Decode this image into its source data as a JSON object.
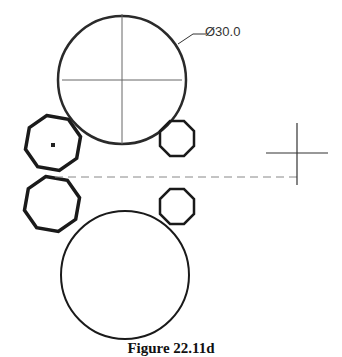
{
  "figure": {
    "dimension_label": "Ø30.0",
    "caption": "Figure 22.11d",
    "colors": {
      "outline": "#1a1a1a",
      "thin": "#555555",
      "dashed": "#888888"
    }
  },
  "shapes": [
    {
      "name": "large-circle-top",
      "kind": "circle",
      "has_center_mark": true
    },
    {
      "name": "octagon-left-upper",
      "kind": "octagon",
      "selected_marker": true
    },
    {
      "name": "octagon-right-upper",
      "kind": "octagon"
    },
    {
      "name": "octagon-left-lower",
      "kind": "octagon"
    },
    {
      "name": "octagon-right-lower",
      "kind": "octagon"
    },
    {
      "name": "large-circle-bottom",
      "kind": "circle"
    }
  ]
}
